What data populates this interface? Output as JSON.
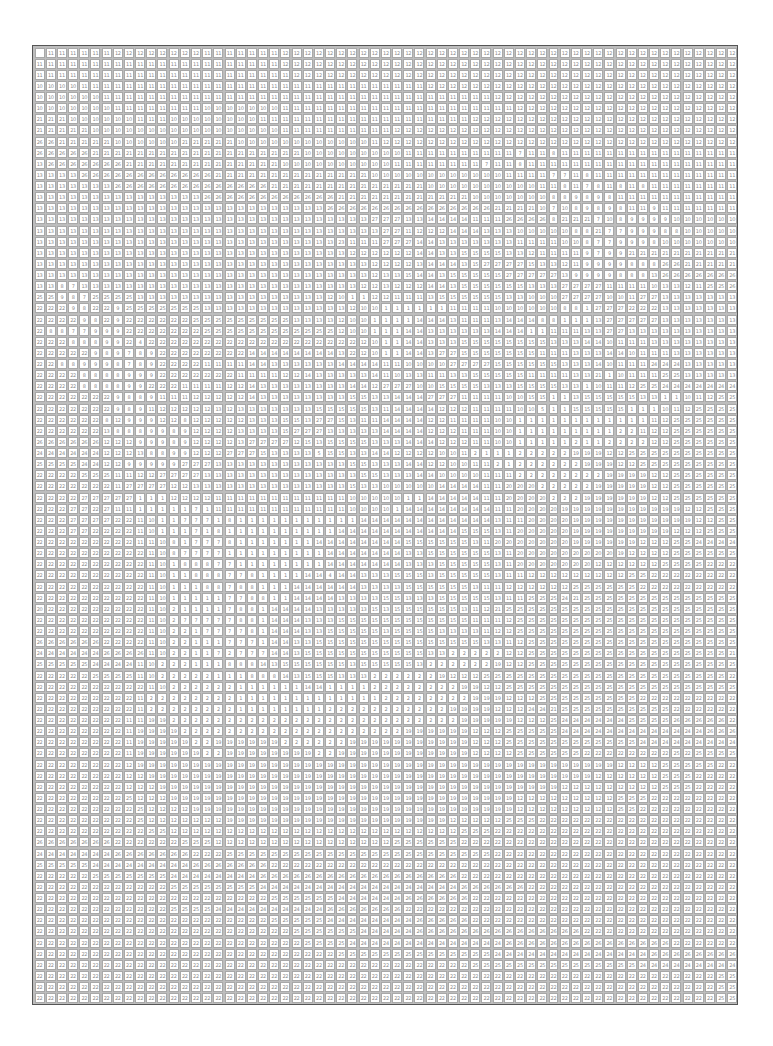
{
  "puzzle": {
    "type": "paint-by-number",
    "columns": 63,
    "rows": 86,
    "blank_cells": [
      [
        0,
        0
      ]
    ],
    "row_runs": [
      "_:1,11:6,12:8,11:7,12:41",
      "11:22,12:41",
      "11:23,12:40",
      "10:4,11:31,12:28",
      "10:6,11:35,12:22",
      "10:7,11:8,10:7,11:21,12:20",
      "21:3,10:6,11:3,10:8,11:19,12:24",
      "21:5,10:17,11:10,12:31",
      "26:2,21:5,10:6,21:5,10:12,11:1,12:32",
      "26:5,21:19,10:9,11:10,7:1,11:2,8:1,11:10",
      "13:1,26:7,21:14,10:10,11:8,7:1,11:2,8:1,11:19",
      "13:4,26:12,21:14,10:12,11:4,7:2,11:1,8:1,11:13",
      "13:7,26:14,21:14,10:10,11:2,8:1,11:1,7:1,8:1,11:1,8:1,11:1,8:1,11:9",
      "13:15,26:12,21:12,10:7,8:2,9:1,8:1,9:1,8:1,11:12",
      "13:26,26:15,21:4,10:1,7:1,10:1,8:1,9:1,8:1,9:1,8:1,11:2,9:1,11:9",
      "13:30,27:3,13:2,14:4,11:3,26:4,8:1,21:3,7:1,10:1,8:1,9:4,10:5",
      "13:31,27:2,11:1,12:3,14:3,13:3,10:5,8:2,21:1,7:2,9:3,8:2,10:6",
      "13:27,23:1,11:1,11:2,27:3,14:2,13:7,11:4,10:2,8:1,7:2,9:3,8:1,10:8",
      "13:28,12:2,12:4,14:2,13:2,15:4,13:2,12:1,11:4,9:1,7:1,9:2,21:12",
      "13:30,12:2,12:2,13:1,14:3,13:1,15:1,27:4,15:1,13:2,12:1,11:1,9:4,8:3,26:2,21:6",
      "13:30,12:1,13:2,15:1,14:2,13:1,15:5,27:5,13:1,9:4,8:3,13:1,26:9",
      "13:2,8:1,7:1,13:25,12:2,13:1,12:3,14:2,13:1,15:6,13:3,27:4,11:4,10:1,13:2,12:1,11:1,25:2,26:5",
      "25:2,9:1,8:1,7:1,25:4,13:17,12:1,10:1,1:2,12:2,11:3,13:1,15:6,13:2,10:3,27:4,10:2,11:1,27:2,13:7",
      "22:3,9:1,8:1,22:2,9:1,25:7,13:13,12:1,10:2,1:6,11:4,10:6,8:2,1:1,27:3,22:3,13:6",
      "22:4,9:1,8:1,22:1,9:1,22:6,25:9,13:4,12:1,10:2,1:4,14:3,13:1,11:3,13:1,14:3,8:2,1:3,13:1,27:5,13:6",
      "22:1,8:2,7:2,9:3,22:7,25:8,25:4,12:1,10:2,1:3,14:2,13:6,14:3,1:2,11:3,13:2,27:2,13:7",
      "22:3,8:3,9:2,22:1,4:1,22:19,12:1,10:1,1:2,14:2,13:3,15:8,13:3,14:2,10:1,11:3,13:12",
      "22:5,9:1,8:1,9:1,7:1,8:1,9:1,22:8,14:8,13:1,22:1,12:1,10:1,1:2,14:2,13:1,27:2,15:7,11:3,13:3,14:2,10:1,11:3,13:11",
      "22:2,8:2,9:3,8:1,7:1,8:1,9:1,22:4,11:4,14:2,13:6,14:4,11:2,10:1,10:3,27:4,15:6,13:3,14:1,10:1,11:3,24:3,13:6",
      "22:4,8:4,9:3,22:7,11:4,12:2,14:1,13:5,14:1,11:1,10:1,13:2,11:2,13:2,15:5,11:4,13:2,21:1,1:1,10:1,11:3,25:2,13:7",
      "22:4,8:4,9:2,22:3,11:4,12:2,14:1,13:8,14:2,12:1,27:3,10:2,15:4,13:2,13:1,15:4,13:2,1:1,10:1,11:2,12:1,25:2,24:3,24:3,24:2",
      "22:7,9:1,8:2,9:1,11:3,12:5,14:1,13:8,15:2,13:2,14:3,27:1,27:2,11:4,10:2,15:2,1:2,13:1,15:5,13:2,1:2,10:1,11:1,12:1,25:12",
      "22:7,9:1,8:1,9:1,11:1,12:5,13:1,12:1,13:7,15:5,13:1,11:1,14:4,12:1,12:2,11:4,10:2,5:1,1:2,15:5,1:3,10:1,11:1,12:1,25:12",
      "22:6,8:1,12:1,9:3,12:2,8:1,12:5,13:3,15:2,13:1,27:2,15:1,13:1,11:2,14:4,12:2,11:4,10:2,1:12,11:1,12:1,25:12",
      "22:6,13:1,8:3,9:1,9:1,8:1,9:1,12:4,13:4,15:1,27:3,13:2,13:3,14:2,14:2,12:3,11:3,10:2,1:9,2:2,11:1,12:2,25:11",
      "26:6,12:3,9:3,8:1,9:1,12:4,13:1,27:4,12:1,15:1,13:1,15:4,13:3,14:3,12:2,12:1,11:2,10:2,1:3,1:2,2:1,1:2,2:4,12:2,25:12",
      "24:6,12:3,13:1,8:2,9:2,12:3,27:3,15:1,13:4,5:1,15:2,13:2,14:2,12:4,10:2,11:1,2:1,1:3,2:5,19:3,12:2,25:12",
      "25:4,24:2,12:2,9:5,27:3,13:12,15:2,13:3,14:2,12:2,10:2,11:2,2:1,1:1,2:6,19:3,12:2,25:12",
      "22:4,25:2,25:1,11:1,11:1,12:2,27:4,13:14,15:2,13:3,14:2,10:4,11:3,2:8,19:4,12:2,25:12",
      "22:7,11:1,27:4,12:2,13:14,15:1,13:2,10:1,10:4,14:4,11:2,20:3,2:5,19:5,12:2,25:9,22:1",
      "22:4,27:5,1:3,12:4,11:12,10:4,10:1,1:2,14:5,11:2,20:4,2:3,19:6,12:2,25:8,22:2",
      "22:3,27:2,22:1,27:1,11:2,1:5,7:1,1:1,11:12,10:4,1:1,14:1,14:7,11:2,20:4,19:11,12:2,25:8,22:3",
      "22:3,27:4,22:2,11:1,10:1,1:2,7:3,1:1,8:1,1:11,14:6,14:6,13:1,11:2,20:4,19:11,12:2,25:4,22:5",
      "22:3,27:2,22:4,11:1,10:1,1:3,7:1,1:1,8:1,1:10,14:7,14:4,15:3,13:1,11:1,20:5,19:9,12:3,25:4,26:4,22:1",
      "22:9,11:2,10:1,8:1,1:1,7:3,8:1,1:7,14:6,14:2,15:6,13:1,11:1,20:7,19:6,12:3,25:2,24:8,25:1",
      "22:10,11:1,10:1,8:1,7:2,7:2,1:9,14:7,13:1,13:1,15:6,13:1,11:1,20:9,19:1,12:4,25:13,24:2",
      "22:10,11:1,10:1,1:1,8:3,7:2,1:8,14:7,13:2,13:1,15:5,13:1,11:1,20:4,20:3,12:6,25:4,22:9,25:2",
      "22:10,11:1,10:1,1:2,8:3,7:1,7:1,8:1,1:4,14:2,4:1,14:2,13:3,15:3,13:1,15:5,13:1,11:2,12:9,25:2,22:11",
      "22:10,11:1,10:1,1:3,8:2,7:1,8:2,1:3,14:6,13:4,15:6,13:1,11:1,11:1,12:3,12:3,25:6,22:13",
      "22:10,11:1,10:1,1:5,7:2,8:2,1:2,14:4,13:4,15:2,13:3,15:5,13:1,11:2,25:3,24:1,21:1,25:17,22:3",
      "20:1,22:9,11:1,10:1,2:1,1:4,7:1,8:2,1:1,14:4,13:5,15:1,13:1,15:5,15:1,13:1,11:1,12:1,21:1,25:22,22:3",
      "22:10,11:1,10:1,2:1,7:5,8:2,1:1,14:3,13:3,15:6,15:1,15:5,11:3,12:1,25:26",
      "22:10,11:1,10:1,2:2,1:1,7:4,8:1,1:1,14:3,13:2,15:5,13:1,15:4,13:2,13:2,11:1,12:2,25:28",
      "26:6,22:4,11:1,10:1,2:2,1:3,7:3,1:1,14:2,13:2,15:15,13:2,11:1,12:1,25:29",
      "24:6,26:4,11:1,10:1,2:2,1:2,7:1,2:1,7:3,14:2,13:1,15:11,13:2,2:1,2:4,12:2,25:18,21:2,25:3,22:2",
      "25:5,24:4,11:1,10:1,2:3,1:3,8:3,14:1,13:1,15:6,13:1,15:5,13:1,2:6,19:1,12:2,25:20,22:3",
      "22:5,25:4,11:1,10:1,2:5,1:3,8:3,14:1,13:1,15:3,13:3,2:1,2:5,19:1,12:2,12:1,25:22,22:5",
      "22:10,11:1,10:1,2:6,1:6,14:2,1:3,1:1,2:4,2:4,19:2,12:2,25:22,22:4",
      "22:9,11:1,2:8,1:11,1:2,2:8,19:3,12:2,12:1,25:9,22:12",
      "22:9,11:1,2:8,1:6,1:2,2:8,2:3,19:4,12:3,24:2,21:1,25:10,22:9",
      "22:8,11:2,19:2,2:24,2:2,19:5,12:3,25:1,24:6,25:4,26:5,22:7",
      "22:8,11:1,19:4,2:19,2:1,19:6,12:3,25:5,24:6,24:7,26:6",
      "22:8,11:1,19:5,2:2,19:6,2:6,19:11,12:3,25:7,25:1,25:4,24:10",
      "22:8,11:1,19:6,2:2,19:8,2:2,19:12,12:4,25:6,22:8,25:1,22:1,25:5",
      "22:8,12:1,19:43,12:4,25:5,22:26",
      "22:8,12:2,19:40,12:6,25:3,22:26",
      "22:8,12:3,19:36,12:9,25:3,22:26",
      "22:8,25:1,12:3,19:31,12:9,25:3,22:30",
      "22:9,25:1,12:4,19:29,12:9,25:2,22:30",
      "22:9,25:1,12:5,12:2,19:20,12:5,25:3,22:39",
      "22:10,25:2,12:23,12:3,25:3,22:35",
      "26:7,22:6,25:3,12:16,25:6,22:35",
      "24:7,26:6,26:1,22:3,25:24,22:32",
      "25:5,24:9,26:1,26:6,22:23,22:17",
      "22:5,25:7,24:8,26:11,26:3,26:4,22:8,22:17",
      "22:12,25:8,24:10,24:8,26:6,22:19",
      "22:21,25:6,24:6,26:6,22:24",
      "22:12,25:4,24:1,24:9,26:5,26:2,22:12,22:18",
      "22:21,25:5,24:4,24:4,26:5,22:20,22:4",
      "22:23,25:6,24:5,26:8,26:7,22:8,22:6",
      "22:24,25:4,24:9,24:5,26:9,26:6,22:6",
      "22:27,25:8,25:6,24:6,24:8,26:8",
      "22:39,25:7,25:8,24:7,24:2",
      "22:61,25:2"
    ]
  }
}
